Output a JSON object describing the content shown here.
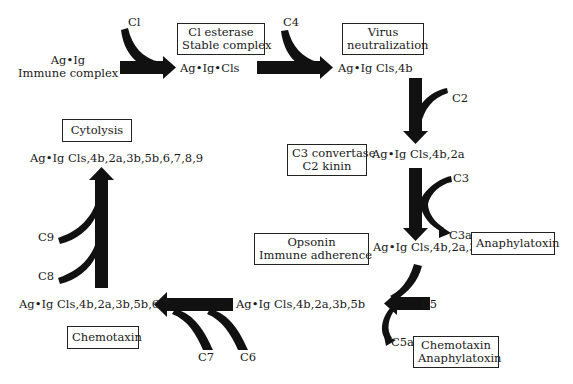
{
  "diagram": {
    "type": "complement-cascade",
    "nodes": {
      "start_line1": "Ag•Ig",
      "start_line2": "Immune complex",
      "n1": "Ag•Ig•Cls",
      "n2": "Ag•Ig Cls,4b",
      "n3": "Ag•Ig Cls,4b,2a",
      "n4": "Ag•Ig Cls,4b,2a,3b",
      "n5": "Ag•Ig Cls,4b,2a,3b,5b",
      "n6": "Ag•Ig Cls,4b,2a,3b,5b,6,7",
      "n7": "Ag•Ig Cls,4b,2a,3b,5b,6,7,8,9"
    },
    "inputs": {
      "c1": "Cl",
      "c4": "C4",
      "c2": "C2",
      "c3": "C3",
      "c3a": "C3a",
      "c5": "C5",
      "c5a": "C5a",
      "c6": "C6",
      "c7": "C7",
      "c8": "C8",
      "c9": "C9"
    },
    "boxes": {
      "esterase_line1": "Cl esterase",
      "esterase_line2": "Stable complex",
      "virus_line1": "Virus",
      "virus_line2": "neutralization",
      "c3conv_line1": "C3 convertase",
      "c3conv_line2": "C2 kinin",
      "opsonin_line1": "Opsonin",
      "opsonin_line2": "Immune adherence",
      "anaphylatoxin": "Anaphylatoxin",
      "chemo_ana_line1": "Chemotaxin",
      "chemo_ana_line2": "Anaphylatoxin",
      "chemotaxin": "Chemotaxin",
      "cytolysis": "Cytolysis"
    },
    "colors": {
      "arrow": "#111111",
      "text": "#1a1a1a",
      "box_border": "#222222"
    }
  }
}
